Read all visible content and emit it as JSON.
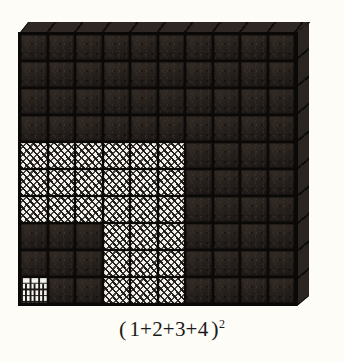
{
  "figure": {
    "caption": {
      "open_paren": "(",
      "expression": "1+2+3+4",
      "close_paren": ")",
      "exponent": "2",
      "full_text": "( 1+2+3+4 )2"
    },
    "grid": {
      "rows": 10,
      "columns": 10,
      "total_cells": 100,
      "cell_fills": [
        [
          "dark",
          "dark",
          "dark",
          "dark",
          "dark",
          "dark",
          "dark",
          "dark",
          "dark",
          "dark"
        ],
        [
          "dark",
          "dark",
          "dark",
          "dark",
          "dark",
          "dark",
          "dark",
          "dark",
          "dark",
          "dark"
        ],
        [
          "dark",
          "dark",
          "dark",
          "dark",
          "dark",
          "dark",
          "dark",
          "dark",
          "dark",
          "dark"
        ],
        [
          "dark",
          "dark",
          "dark",
          "dark",
          "dark",
          "dark",
          "dark",
          "dark",
          "dark",
          "dark"
        ],
        [
          "hatch",
          "hatch",
          "hatch",
          "hatch",
          "hatch",
          "hatch",
          "dark",
          "dark",
          "dark",
          "dark"
        ],
        [
          "hatch",
          "hatch",
          "hatch",
          "hatch",
          "hatch",
          "hatch",
          "dark",
          "dark",
          "dark",
          "dark"
        ],
        [
          "hatch",
          "hatch",
          "hatch",
          "hatch",
          "hatch",
          "hatch",
          "dark",
          "dark",
          "dark",
          "dark"
        ],
        [
          "dark",
          "dark",
          "dark",
          "hatch",
          "hatch",
          "hatch",
          "dark",
          "dark",
          "dark",
          "dark"
        ],
        [
          "dark",
          "dark",
          "dark",
          "hatch",
          "hatch",
          "hatch",
          "dark",
          "dark",
          "dark",
          "dark"
        ],
        [
          "brick",
          "dark",
          "dark",
          "hatch",
          "hatch",
          "hatch",
          "dark",
          "dark",
          "dark",
          "dark"
        ]
      ],
      "legend": {
        "dark": "unshaded cube face",
        "hatch": "diagonally hatched cube face",
        "brick": "brick-patterned single unit cube"
      }
    },
    "colors": {
      "background": "#fdfcf7",
      "cube_dark": "#2c2520",
      "cube_hatch_base": "#f4f2ec",
      "cube_brick_base": "#f6f4ee",
      "grid_line": "#0a0908",
      "caption_text": "#1a1a1a"
    }
  }
}
